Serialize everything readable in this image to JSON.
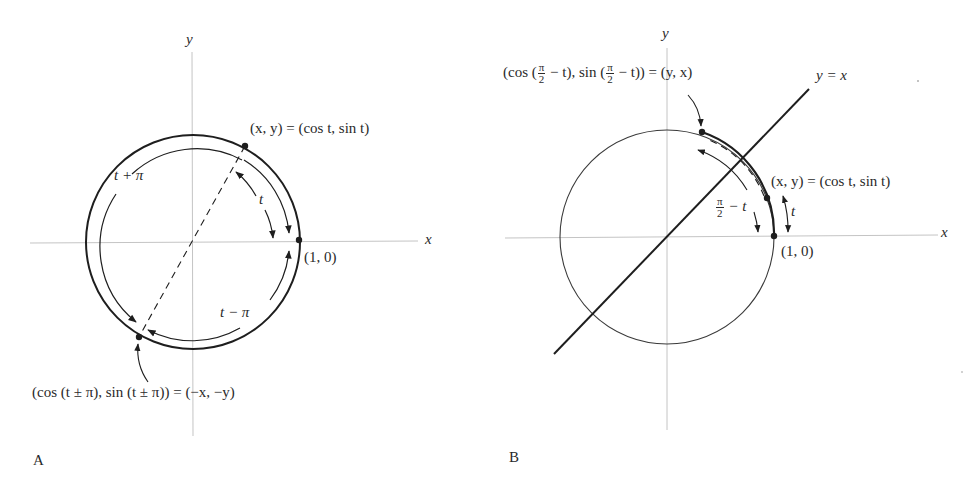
{
  "panels": [
    {
      "id": "A",
      "letter": "A",
      "axes": {
        "x_label": "x",
        "y_label": "y"
      },
      "labels": {
        "point_t": "(x, y) = (cos t, sin t)",
        "point_t_lhs": "(x, y)",
        "point_t_rhs": "= (cos t, sin t)",
        "unit_point": "(1, 0)",
        "arc_t": "t",
        "arc_t_plus_pi": "t + π",
        "arc_t_minus_pi": "t − π",
        "antipode": "(cos (t ± π), sin (t ± π)) = (−x, −y)"
      }
    },
    {
      "id": "B",
      "letter": "B",
      "axes": {
        "x_label": "x",
        "y_label": "y"
      },
      "labels": {
        "line": "y = x",
        "reflected_point_prefix_cos": "(cos (",
        "reflected_point_mid": " − t), sin (",
        "reflected_point_suffix": " − t)) = (y, x)",
        "frac_num": "π",
        "frac_den": "2",
        "point_t": "(x, y) = (cos t, sin t)",
        "unit_point": "(1, 0)",
        "arc_t": "t",
        "arc_complement_suffix": " − t"
      }
    }
  ],
  "colors": {
    "stroke_dark": "#1e1e1e",
    "axis": "#bdbdbd",
    "text": "#2a2a2a",
    "background": "#ffffff"
  }
}
